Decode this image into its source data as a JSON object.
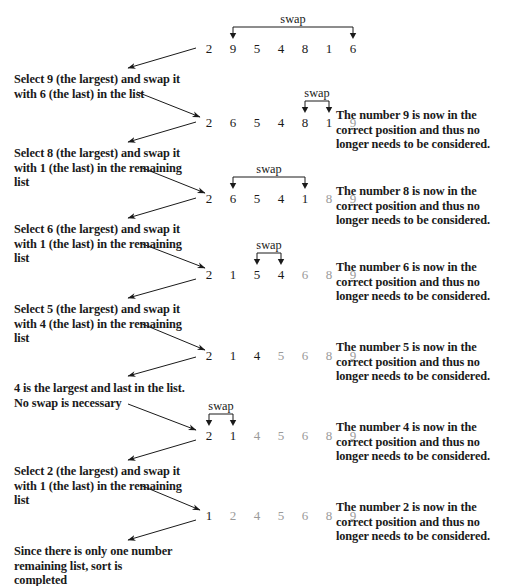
{
  "diagram": {
    "swap_label": "swap",
    "colors": {
      "ink": "#1a1a1a",
      "sorted": "#9a9a9a",
      "background": "#ffffff"
    }
  },
  "rows": [
    {
      "id": "row-1",
      "values": [
        "2",
        "9",
        "5",
        "4",
        "8",
        "1",
        "6"
      ],
      "sorted_from": 7,
      "swap": {
        "from": 1,
        "to": 6,
        "label": "swap"
      }
    },
    {
      "id": "row-2",
      "values": [
        "2",
        "6",
        "5",
        "4",
        "8",
        "1",
        "9"
      ],
      "sorted_from": 6,
      "swap": {
        "from": 4,
        "to": 5,
        "label": "swap"
      }
    },
    {
      "id": "row-3",
      "values": [
        "2",
        "6",
        "5",
        "4",
        "1",
        "8",
        "9"
      ],
      "sorted_from": 5,
      "swap": {
        "from": 1,
        "to": 4,
        "label": "swap"
      }
    },
    {
      "id": "row-4",
      "values": [
        "2",
        "1",
        "5",
        "4",
        "6",
        "8",
        "9"
      ],
      "sorted_from": 4,
      "swap": {
        "from": 2,
        "to": 3,
        "label": "swap"
      }
    },
    {
      "id": "row-5",
      "values": [
        "2",
        "1",
        "4",
        "5",
        "6",
        "8",
        "9"
      ],
      "sorted_from": 3,
      "swap": null
    },
    {
      "id": "row-6",
      "values": [
        "2",
        "1",
        "4",
        "5",
        "6",
        "8",
        "9"
      ],
      "sorted_from": 2,
      "swap": {
        "from": 0,
        "to": 1,
        "label": "swap"
      }
    },
    {
      "id": "row-7",
      "values": [
        "1",
        "2",
        "4",
        "5",
        "6",
        "8",
        "9"
      ],
      "sorted_from": 1,
      "swap": null
    }
  ],
  "descriptions": [
    {
      "id": "desc-1",
      "lines": [
        "Select 9 (the largest) and swap it",
        "with 6 (the last) in the list"
      ]
    },
    {
      "id": "desc-2",
      "lines": [
        "Select 8 (the largest) and swap it",
        "with 1 (the last) in the remaining",
        "list"
      ]
    },
    {
      "id": "desc-3",
      "lines": [
        "Select 6 (the largest) and swap it",
        "with 1 (the last) in the remaining",
        "list"
      ]
    },
    {
      "id": "desc-4",
      "lines": [
        "Select 5 (the largest) and swap it",
        "with 4 (the last) in the remaining",
        "list"
      ]
    },
    {
      "id": "desc-5",
      "lines": [
        "4 is the largest and last in the list.",
        "No swap is necessary"
      ]
    },
    {
      "id": "desc-6",
      "lines": [
        "Select 2 (the largest) and swap it",
        "with 1 (the last) in the remaining",
        "list"
      ]
    },
    {
      "id": "desc-7",
      "lines": [
        "Since there is only one number",
        "remaining list, sort is",
        "completed"
      ]
    }
  ],
  "notes": [
    {
      "id": "note-9",
      "lines": [
        "The number 9 is now in the",
        "correct position and thus no",
        "longer needs to be considered."
      ]
    },
    {
      "id": "note-8",
      "lines": [
        "The number 8 is now in the",
        "correct position and thus no",
        "longer needs to be considered."
      ]
    },
    {
      "id": "note-6",
      "lines": [
        "The number 6 is now in the",
        "correct position and thus no",
        "longer needs to be considered."
      ]
    },
    {
      "id": "note-5",
      "lines": [
        "The number 5 is now in the",
        "correct position and thus no",
        "longer needs to be considered."
      ]
    },
    {
      "id": "note-4",
      "lines": [
        "The number 4 is now in the",
        "correct position and thus no",
        "longer needs to be considered."
      ]
    },
    {
      "id": "note-2",
      "lines": [
        "The number 2 is now in the",
        "correct position and thus no",
        "longer needs to be considered."
      ]
    }
  ]
}
